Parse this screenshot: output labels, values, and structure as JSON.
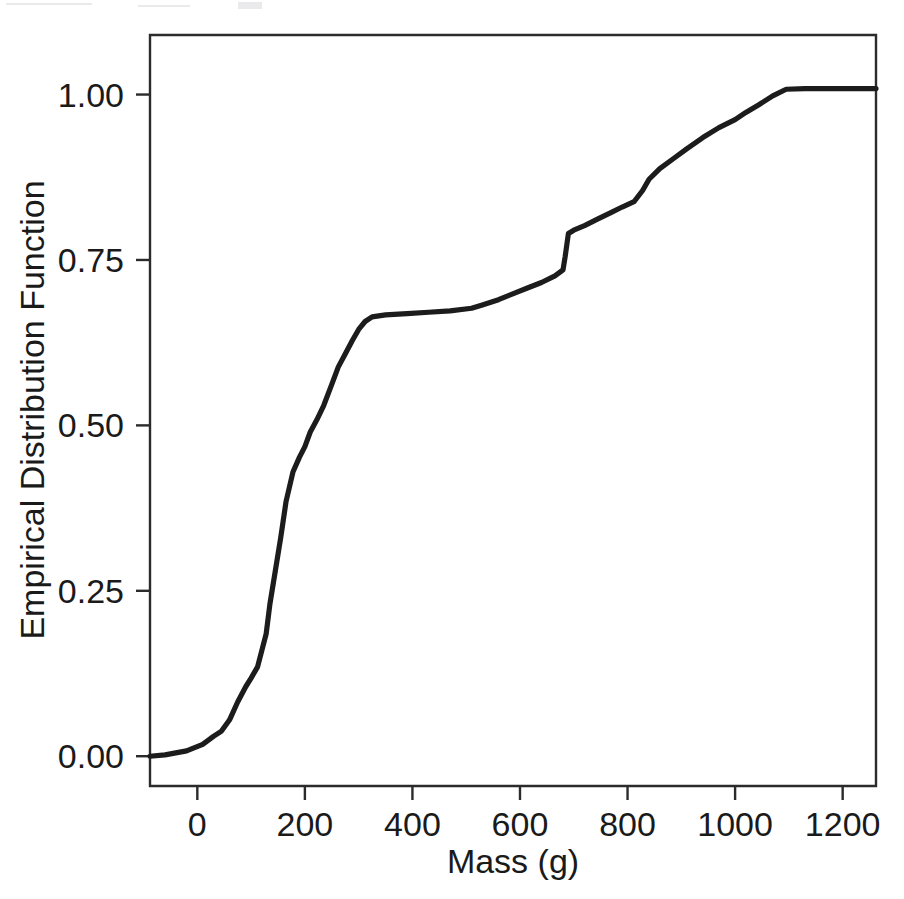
{
  "figure": {
    "background_color": "#ffffff",
    "line_color": "#1c1c1c",
    "axis_color": "#2b2b2b",
    "frame": {
      "left": 150,
      "top": 35,
      "right": 876,
      "bottom": 786
    }
  },
  "axes": {
    "x": {
      "title": "Mass (g)",
      "tick_labels": [
        "0",
        "200",
        "400",
        "600",
        "800",
        "1000",
        "1200"
      ],
      "tick_values": [
        0,
        200,
        400,
        600,
        800,
        1000,
        1200
      ],
      "range": [
        -88,
        1262
      ]
    },
    "y": {
      "title": "Empirical Distribution Function",
      "tick_labels": [
        "0.00",
        "0.25",
        "0.50",
        "0.75",
        "1.00"
      ],
      "tick_values": [
        0.0,
        0.25,
        0.5,
        0.75,
        1.0
      ],
      "range": [
        -0.045,
        1.09
      ]
    }
  },
  "chart_data": {
    "type": "line",
    "title": "",
    "subtitle": "",
    "xlabel": "Mass (g)",
    "ylabel": "Empirical Distribution Function",
    "xlim": [
      -88,
      1262
    ],
    "ylim": [
      -0.045,
      1.09
    ],
    "xticks": [
      0,
      200,
      400,
      600,
      800,
      1000,
      1200
    ],
    "yticks": [
      0.0,
      0.25,
      0.5,
      0.75,
      1.0
    ],
    "grid": false,
    "legend": null,
    "legend_position": "none",
    "series": [
      {
        "name": "Empirical Distribution Function",
        "color": "#1c1c1c",
        "x": [
          -88,
          -60,
          -20,
          10,
          30,
          45,
          60,
          75,
          90,
          100,
          112,
          120,
          128,
          135,
          145,
          155,
          165,
          178,
          190,
          200,
          210,
          222,
          235,
          250,
          262,
          275,
          288,
          300,
          312,
          325,
          350,
          390,
          430,
          470,
          510,
          530,
          560,
          590,
          615,
          640,
          665,
          680,
          684,
          690,
          700,
          720,
          745,
          770,
          790,
          812,
          828,
          840,
          860,
          885,
          910,
          940,
          970,
          1000,
          1020,
          1045,
          1070,
          1095,
          1130,
          1180,
          1262
        ],
        "y": [
          0.0,
          0.002,
          0.008,
          0.018,
          0.03,
          0.038,
          0.055,
          0.082,
          0.105,
          0.118,
          0.135,
          0.16,
          0.185,
          0.23,
          0.28,
          0.33,
          0.385,
          0.43,
          0.452,
          0.468,
          0.49,
          0.508,
          0.53,
          0.562,
          0.588,
          0.608,
          0.628,
          0.645,
          0.657,
          0.664,
          0.667,
          0.669,
          0.671,
          0.673,
          0.677,
          0.682,
          0.69,
          0.7,
          0.708,
          0.716,
          0.726,
          0.735,
          0.755,
          0.79,
          0.795,
          0.802,
          0.812,
          0.822,
          0.83,
          0.838,
          0.855,
          0.872,
          0.888,
          0.903,
          0.918,
          0.935,
          0.95,
          0.962,
          0.973,
          0.985,
          0.998,
          1.008,
          1.009,
          1.009,
          1.009
        ]
      }
    ]
  }
}
